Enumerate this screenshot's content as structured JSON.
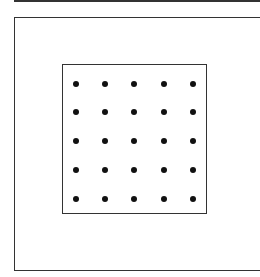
{
  "diagram": {
    "type": "dot-grid-in-box",
    "rows": 5,
    "cols": 5,
    "dot_color": "#111111",
    "line_color": "#333333",
    "dots_x": [
      76,
      105,
      134,
      164,
      193
    ],
    "dots_y": [
      84,
      112,
      141,
      170,
      199
    ]
  }
}
